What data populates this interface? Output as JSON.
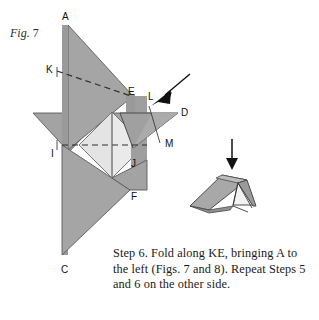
{
  "figure": {
    "label_word": "Fig.",
    "label_number": "7"
  },
  "caption": {
    "text": "Step 6. Fold along KE, bringing A to the left (Figs. 7 and 8). Repeat Steps 5 and 6 on the other side."
  },
  "colors": {
    "paper_gray": "#a3a3a3",
    "paper_gray_dark": "#8d8d8d",
    "paper_light": "#e9e9e9",
    "paper_mid": "#bdbdbd",
    "outline": "#4a4a4a",
    "dash": "#3c3c3c",
    "arrow": "#111111",
    "text": "#1a1a1a"
  },
  "point_labels": [
    {
      "id": "A",
      "text": "A",
      "x": 62,
      "y": 20
    },
    {
      "id": "K",
      "text": "K",
      "x": 46,
      "y": 73
    },
    {
      "id": "E",
      "text": "E",
      "x": 128,
      "y": 95
    },
    {
      "id": "L",
      "text": "L",
      "x": 148,
      "y": 100
    },
    {
      "id": "D",
      "text": "D",
      "x": 181,
      "y": 116
    },
    {
      "id": "M",
      "text": "M",
      "x": 165,
      "y": 147
    },
    {
      "id": "I",
      "text": "I",
      "x": 51,
      "y": 157
    },
    {
      "id": "J",
      "text": "J",
      "x": 131,
      "y": 167
    },
    {
      "id": "F",
      "text": "F",
      "x": 131,
      "y": 200
    },
    {
      "id": "C",
      "text": "C",
      "x": 61,
      "y": 273
    }
  ],
  "arrows": [
    {
      "id": "fold-arrow-diagonal",
      "name": "diagonal-fold-arrow"
    },
    {
      "id": "fold-arrow-down",
      "name": "down-fold-arrow"
    }
  ],
  "shapes": {
    "main_figure_name": "origami-step-7-diagram",
    "result_figure_name": "folded-result-3d"
  }
}
